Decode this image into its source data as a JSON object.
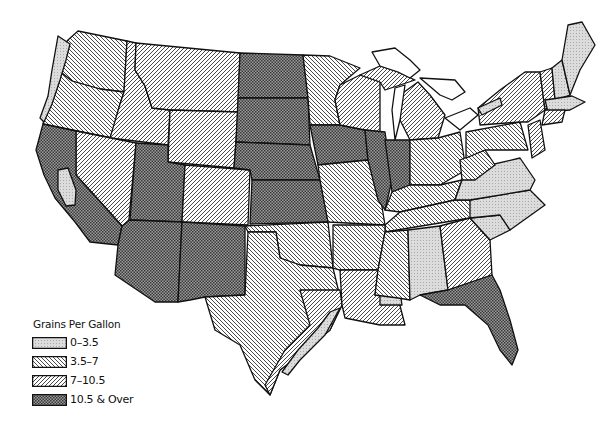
{
  "map": {
    "subject": "Water hardness in the United States",
    "legend": {
      "title": "Grains Per Gallon",
      "classes": [
        {
          "label": "0–3.5",
          "pattern": "dotted-light",
          "fill": "#d9d9d9"
        },
        {
          "label": "3.5–7",
          "pattern": "hatch-backslash",
          "fill": "#ffffff"
        },
        {
          "label": "7–10.5",
          "pattern": "hatch-slash",
          "fill": "#ffffff"
        },
        {
          "label": "10.5 & Over",
          "pattern": "crosshatch-dense",
          "fill": "#888888"
        }
      ]
    },
    "colors": {
      "line": "#111111",
      "background": "#ffffff",
      "light_fill": "#d9d9d9",
      "dark_fill": "#8a8a8a"
    }
  }
}
